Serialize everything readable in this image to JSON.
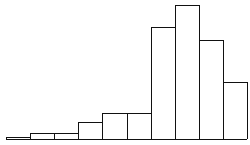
{
  "chart_data": {
    "type": "bar",
    "title": "",
    "xlabel": "",
    "ylabel": "",
    "grid": false,
    "legend": null,
    "categories": [
      "1",
      "2",
      "3",
      "4",
      "5",
      "6",
      "7",
      "8",
      "9",
      "10"
    ],
    "values": [
      2,
      6,
      6,
      17,
      26,
      26,
      112,
      134,
      99,
      57
    ],
    "ylim": [
      0,
      134
    ],
    "colors": {
      "bar_fill": "#ffffff",
      "bar_edge": "#111111"
    },
    "layout": {
      "plot_left": 6,
      "bar_width": 24.1,
      "baseline_y": 139,
      "px_per_unit": 1
    }
  }
}
